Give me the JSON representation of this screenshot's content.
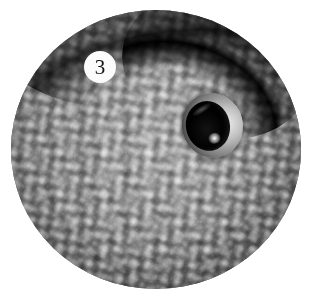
{
  "figure": {
    "kind": "photograph",
    "color_mode": "grayscale",
    "crop_shape": "circle",
    "background_color": "#ffffff"
  },
  "panel_label": {
    "text": "3",
    "shape": "circle",
    "background_color": "#fbfbfb",
    "text_color": "#151515"
  },
  "palette": {
    "skin_light": "#b2b2b2",
    "skin_mid": "#8d8d8d",
    "skin_dark": "#6a6a6a",
    "fold_shadow": "#0a0a0a",
    "eye_pupil": "#050505",
    "eye_rim_light": "#e6e6e6",
    "eye_highlight": "#ffffff"
  }
}
